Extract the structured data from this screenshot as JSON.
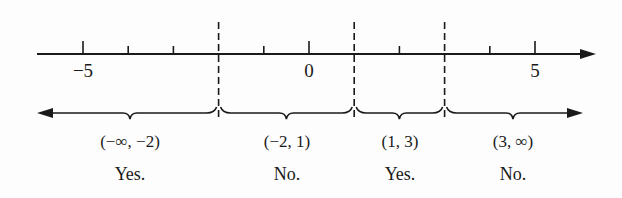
{
  "number_line": {
    "axis_y": 54,
    "x_start": 37,
    "x_end": 596,
    "origin_x": 309,
    "px_per_unit": 45.2,
    "ticks": [
      -5,
      -4,
      -3,
      -2,
      -1,
      0,
      1,
      2,
      3,
      4,
      5
    ],
    "labeled_ticks": [
      {
        "value": -5,
        "label": "−5"
      },
      {
        "value": 0,
        "label": "0"
      },
      {
        "value": 5,
        "label": "5"
      }
    ],
    "critical_points": [
      -2,
      1,
      3
    ]
  },
  "intervals": [
    {
      "label": "(−∞, −2)",
      "answer": "Yes.",
      "from": null,
      "to": -2
    },
    {
      "label": "(−2, 1)",
      "answer": "No.",
      "from": -2,
      "to": 1
    },
    {
      "label": "(1, 3)",
      "answer": "Yes.",
      "from": 1,
      "to": 3
    },
    {
      "label": "(3, ∞)",
      "answer": "No.",
      "from": 3,
      "to": null
    }
  ],
  "colors": {
    "ink": "#1a1a1a",
    "background": "#fdfdfd"
  }
}
